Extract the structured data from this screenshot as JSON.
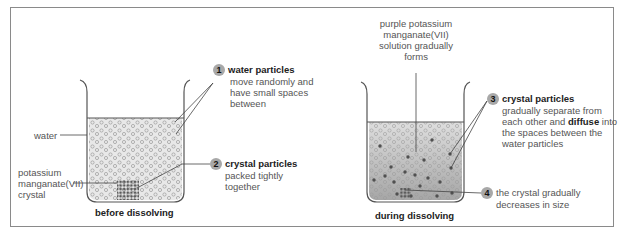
{
  "figure": {
    "beakers": [
      {
        "id": "before",
        "caption": "before dissolving",
        "labels": {
          "water": "water",
          "crystal": [
            "potassium",
            "manganate(VII)",
            "crystal"
          ]
        }
      },
      {
        "id": "during",
        "caption": "during dissolving",
        "labels": {
          "solution": [
            "purple potassium",
            "manganate(VII)",
            "solution gradually",
            "forms"
          ]
        }
      }
    ],
    "callouts": [
      {
        "number": "1",
        "heading": "water particles",
        "text": [
          "move randomly and",
          "have small spaces",
          "between"
        ]
      },
      {
        "number": "2",
        "heading": "crystal particles",
        "text": [
          "packed tightly",
          "together"
        ]
      },
      {
        "number": "3",
        "heading": "crystal particles",
        "text_parts": [
          "gradually separate from",
          "each other and ",
          "diffuse",
          " into",
          "the spaces between the",
          "water particles"
        ]
      },
      {
        "number": "4",
        "heading": "",
        "text": [
          "the crystal gradually",
          "decreases in size"
        ]
      }
    ],
    "colors": {
      "frame": "#8a8a8a",
      "water_fill": "#e6e6e6",
      "solution_top": "#dcdcdc",
      "solution_bottom": "#a9a9a9",
      "water_particle": "#9a9a9a",
      "crystal_particle": "#555555",
      "badge": "#a8a8a8"
    }
  }
}
